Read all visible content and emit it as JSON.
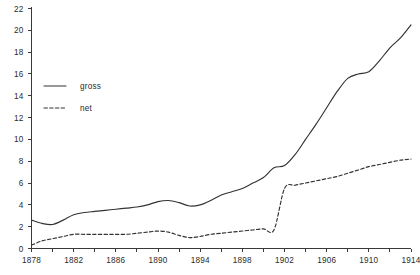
{
  "chart_data": {
    "type": "line",
    "title": "",
    "subtitle": "",
    "xlabel": "",
    "ylabel": "",
    "xlim": [
      1878,
      1914
    ],
    "ylim": [
      0,
      22
    ],
    "grid": false,
    "legend_position": "upper-left-inside",
    "y_ticks": [
      0,
      2,
      4,
      6,
      8,
      10,
      12,
      14,
      16,
      18,
      20,
      22
    ],
    "y_tick_labels": [
      "0",
      "2",
      "4",
      "6",
      "8",
      "10",
      "12",
      "14",
      "16",
      "18",
      "20",
      "22"
    ],
    "x_ticks": [
      1878,
      1880,
      1882,
      1884,
      1886,
      1888,
      1890,
      1892,
      1894,
      1896,
      1898,
      1900,
      1902,
      1904,
      1906,
      1908,
      1910,
      1912,
      1914
    ],
    "x_tick_labels_shown": [
      "1878",
      "1882",
      "1886",
      "1890",
      "1894",
      "1898",
      "1902",
      "1906",
      "1910",
      "1914"
    ],
    "x": [
      1878,
      1879,
      1880,
      1881,
      1882,
      1883,
      1884,
      1885,
      1886,
      1887,
      1888,
      1889,
      1890,
      1891,
      1892,
      1893,
      1894,
      1895,
      1896,
      1897,
      1898,
      1899,
      1900,
      1901,
      1902,
      1903,
      1904,
      1905,
      1906,
      1907,
      1908,
      1909,
      1910,
      1911,
      1912,
      1913,
      1914
    ],
    "series": [
      {
        "name": "gross",
        "style": "solid",
        "color": "#333333",
        "values": [
          2.6,
          2.3,
          2.2,
          2.6,
          3.1,
          3.3,
          3.4,
          3.5,
          3.6,
          3.7,
          3.8,
          4.0,
          4.3,
          4.4,
          4.2,
          3.9,
          4.0,
          4.4,
          4.9,
          5.2,
          5.5,
          6.0,
          6.5,
          7.4,
          7.6,
          8.6,
          10.0,
          11.4,
          12.9,
          14.4,
          15.6,
          16.0,
          16.2,
          17.2,
          18.4,
          19.3,
          20.5
        ]
      },
      {
        "name": "net",
        "style": "dashed",
        "color": "#333333",
        "values": [
          0.3,
          0.7,
          0.9,
          1.1,
          1.3,
          1.3,
          1.3,
          1.3,
          1.3,
          1.3,
          1.4,
          1.5,
          1.6,
          1.5,
          1.2,
          1.0,
          1.1,
          1.3,
          1.4,
          1.5,
          1.6,
          1.7,
          1.8,
          1.7,
          5.5,
          5.8,
          6.0,
          6.2,
          6.4,
          6.6,
          6.9,
          7.2,
          7.5,
          7.7,
          7.9,
          8.1,
          8.2
        ]
      }
    ],
    "legend": [
      {
        "label": "gross",
        "style": "solid"
      },
      {
        "label": "net",
        "style": "dashed"
      }
    ]
  }
}
